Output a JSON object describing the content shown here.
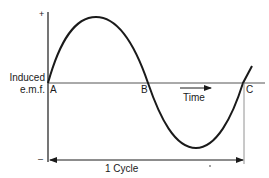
{
  "diagram": {
    "y_axis": {
      "label_line1": "Induced",
      "label_line2": "e.m.f.",
      "positive_marker": "+",
      "negative_marker": "–"
    },
    "x_axis": {
      "label": "Time",
      "arrow_direction": "right"
    },
    "points": {
      "a": "A",
      "b": "B",
      "c": "C"
    },
    "span_label": "1 Cycle",
    "footnote_mark": "*",
    "colors": {
      "line": "#1a1a1a",
      "axis": "#555555",
      "background": "#ffffff"
    }
  }
}
